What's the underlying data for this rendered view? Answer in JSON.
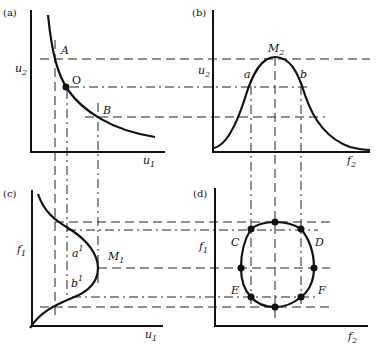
{
  "panels": {
    "a": {
      "tag": "(a)",
      "x_axis": {
        "name": "u",
        "sub": "1"
      },
      "y_axis": {
        "name": "u",
        "sub": "2"
      },
      "points": {
        "A": "A",
        "O": "O",
        "B": "B"
      }
    },
    "b": {
      "tag": "(b)",
      "x_axis": {
        "name": "f",
        "sub": "2"
      },
      "y_axis": {
        "name": "u",
        "sub": "2"
      },
      "peak": {
        "name": "M",
        "sub": "2"
      },
      "points": {
        "a": "a",
        "b": "b"
      }
    },
    "c": {
      "tag": "(c)",
      "x_axis": {
        "name": "u",
        "sub": "1"
      },
      "y_axis": {
        "name": "f",
        "sub": "1"
      },
      "peak": {
        "name": "M",
        "sub": "1"
      },
      "points": {
        "a1": "a",
        "a1_sup": "1",
        "b1": "b",
        "b1_sup": "1"
      }
    },
    "d": {
      "tag": "(d)",
      "x_axis": {
        "name": "f",
        "sub": "2"
      },
      "y_axis": {
        "name": "f",
        "sub": "1"
      },
      "points": {
        "C": "C",
        "D": "D",
        "E": "E",
        "F": "F"
      }
    }
  }
}
